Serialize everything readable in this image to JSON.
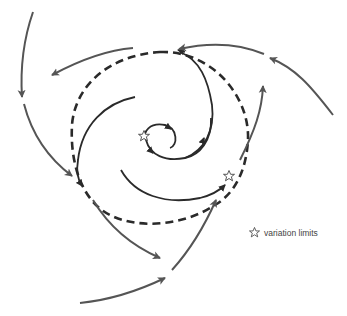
{
  "diagram": {
    "title": "",
    "colors": {
      "background": "#ffffff",
      "solid_line": "#2a2a2a",
      "outer_arrow": "#555555",
      "dashed_circle": "#2a2a2a",
      "star_fill": "#ffffff",
      "star_stroke": "#444444"
    },
    "elements": {
      "dashed_limit_cycle": {
        "type": "dashed-circle",
        "center": [
          165,
          135
        ],
        "radius_approx": 85
      },
      "inner_spiral": {
        "type": "solid-spiral",
        "direction": "clockwise-inward",
        "arrows": 2
      },
      "middle_spirals": {
        "count": 2,
        "type": "solid-arc",
        "converging_to": "dashed_limit_cycle"
      },
      "outer_arrows": {
        "count": 6,
        "type": "double-line-arrow",
        "converging_to": "dashed_limit_cycle"
      },
      "stars": [
        {
          "label": "variation-limit-inner",
          "position": [
            145,
            136
          ]
        },
        {
          "label": "variation-limit-outer",
          "position": [
            229,
            176
          ]
        }
      ]
    }
  },
  "legend": {
    "icon": "star-icon",
    "label": "variation limits"
  }
}
